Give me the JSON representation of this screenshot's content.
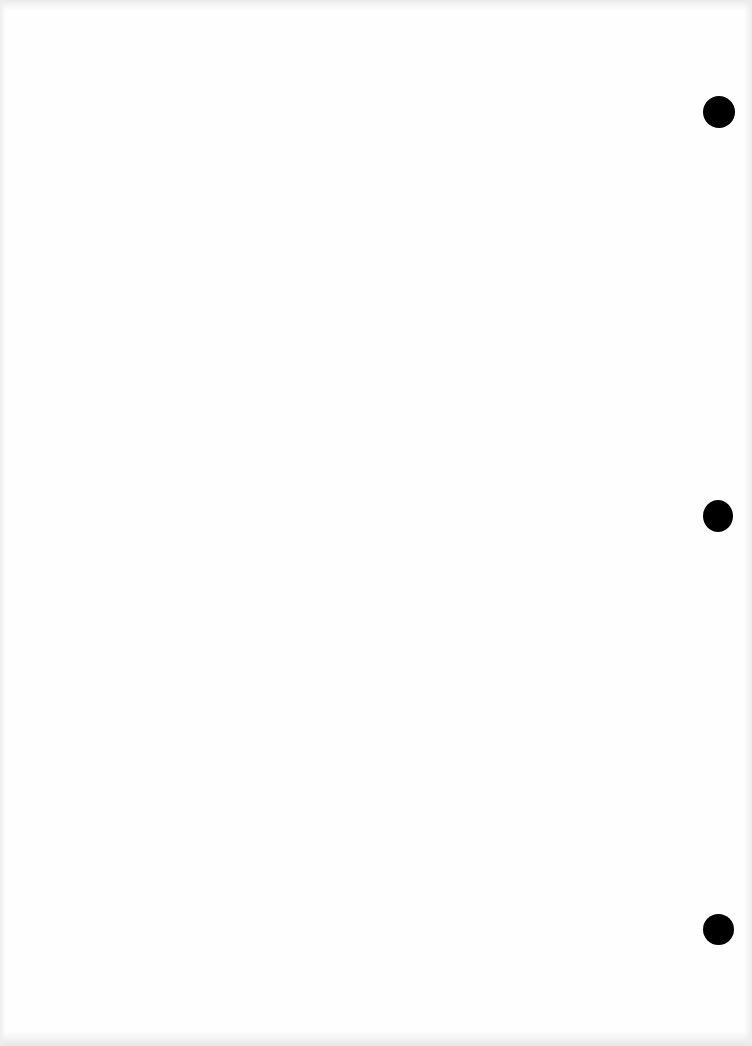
{
  "document": {
    "type": "blank scanned page",
    "background_color": "#fefefe",
    "punch_holes": [
      {
        "cx": 719,
        "cy": 112,
        "w": 32,
        "h": 32,
        "color": "#000000"
      },
      {
        "cx": 718,
        "cy": 516,
        "w": 30,
        "h": 32,
        "color": "#000000"
      },
      {
        "cx": 718,
        "cy": 929,
        "w": 31,
        "h": 31,
        "color": "#000000"
      }
    ]
  }
}
